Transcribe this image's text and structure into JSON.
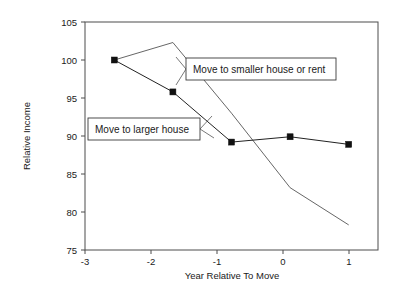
{
  "chart_data": {
    "type": "line",
    "title": "",
    "xlabel": "Year Relative To Move",
    "ylabel": "Relative Income",
    "x": [
      -3,
      -2,
      -1,
      0,
      1
    ],
    "xticklabels": [
      "-3",
      "-2",
      "-1",
      "0",
      "1"
    ],
    "xlim": [
      -3.5,
      1.5
    ],
    "yticklabels": [
      "75",
      "80",
      "85",
      "90",
      "95",
      "100",
      "105"
    ],
    "yticks": [
      75,
      80,
      85,
      90,
      95,
      100,
      105
    ],
    "ylim": [
      75,
      105
    ],
    "grid": false,
    "legend": "inline-annotations",
    "series": [
      {
        "name": "Move to larger house",
        "values": [
          100.0,
          95.8,
          89.2,
          89.9,
          88.9
        ],
        "markers": "filled-square",
        "color": "#222222"
      },
      {
        "name": "Move to smaller house or rent",
        "values": [
          100.0,
          102.3,
          93.0,
          83.2,
          78.3
        ],
        "markers": "none",
        "color": "#555555"
      }
    ],
    "annotations": [
      {
        "label": "Move to smaller house or rent",
        "points_to_series": "Move to smaller house or rent"
      },
      {
        "label": "Move to larger house",
        "points_to_series": "Move to larger house"
      }
    ]
  },
  "axes": {
    "x_title": "Year Relative To Move",
    "y_title": "Relative Income",
    "x_ticks": [
      "-3",
      "-2",
      "-1",
      "0",
      "1"
    ],
    "y_ticks": [
      "105",
      "100",
      "95",
      "90",
      "85",
      "80",
      "75"
    ]
  },
  "annotations": {
    "smaller_house": "Move to smaller house or rent",
    "larger_house": "Move to larger house"
  },
  "colors": {
    "background": "#ffffff",
    "frame": "#4d4d4d",
    "series_larger": "#222222",
    "series_smaller": "#555555",
    "text": "#1a1a1a"
  }
}
